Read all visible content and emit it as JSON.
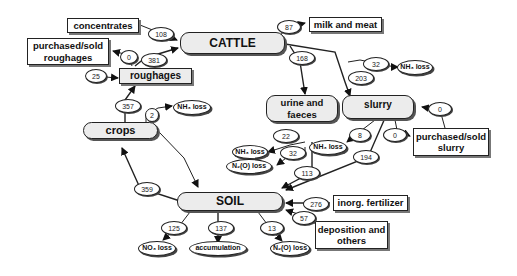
{
  "pools": {
    "cattle": "CATTLE",
    "roughages": "roughages",
    "crops": "crops",
    "urine": "urine and faeces",
    "slurry": "slurry",
    "soil": "SOIL"
  },
  "external": {
    "concentrates": "concentrates",
    "purchased_roughages": "purchased/sold roughages",
    "milk_meat": "milk and meat",
    "purchased_slurry": "purchased/sold slurry",
    "inorg_fertilizer": "inorg. fertilizer",
    "deposition": "deposition and others"
  },
  "losses": {
    "nh3_crops": "NH₃ loss",
    "nh3_cattle": "NH₃ loss",
    "nh3_urine": "NH₃ loss",
    "n2o_urine": "N₂(O) loss",
    "nh3_slurry": "NH₃ loss",
    "no3_soil": "NO₃ loss",
    "accumulation": "accumulation",
    "n2o_soil": "N₂(O) loss"
  },
  "flows": {
    "concentrates_cattle": "108",
    "roughages_to_purchased": "0",
    "roughages_cattle": "381",
    "purchased_to_roughages": "25",
    "crops_roughages": "357",
    "crops_nh3": "2",
    "cattle_milk": "87",
    "cattle_urine": "168",
    "cattle_nh3": "32",
    "cattle_slurry": "203",
    "purchased_slurry_in": "0",
    "slurry_purchased_out": "0",
    "urine_nh3": "22",
    "urine_n2o": "32",
    "urine_soil": "113",
    "slurry_nh3": "8",
    "slurry_soil": "194",
    "soil_crops": "359",
    "fert_soil": "276",
    "depo_soil": "57",
    "soil_no3": "125",
    "soil_accum": "137",
    "soil_n2o": "13"
  }
}
